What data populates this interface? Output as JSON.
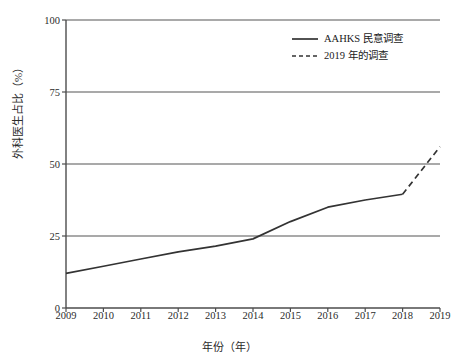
{
  "chart_data": {
    "type": "line",
    "title": "",
    "xlabel": "年份（年）",
    "ylabel": "外科医生占比（%）",
    "xlim": [
      2009,
      2019
    ],
    "ylim": [
      0,
      100
    ],
    "yticks": [
      0,
      25,
      50,
      75,
      100
    ],
    "ytick_labels": [
      "0",
      "25",
      "50",
      "75",
      "100"
    ],
    "xticks": [
      2009,
      2010,
      2011,
      2012,
      2013,
      2014,
      2015,
      2016,
      2017,
      2018,
      2019
    ],
    "xtick_labels": [
      "2009",
      "2010",
      "2011",
      "2012",
      "2013",
      "2014",
      "2015",
      "2016",
      "2017",
      "2018",
      "2019"
    ],
    "grid": "horizontal",
    "legend_position": "top-right-inside",
    "series": [
      {
        "name": "AAHKS 民意调查",
        "style": "solid",
        "color": "#333333",
        "x": [
          2009,
          2010,
          2011,
          2012,
          2013,
          2014,
          2015,
          2016,
          2017,
          2018
        ],
        "values": [
          12,
          14.5,
          17,
          19.5,
          21.5,
          24,
          30,
          35,
          37.5,
          39.5
        ]
      },
      {
        "name": "2019 年的调查",
        "style": "dashed",
        "color": "#333333",
        "x": [
          2018,
          2019
        ],
        "values": [
          39.5,
          56
        ]
      }
    ]
  },
  "legend": {
    "items": [
      {
        "label": "AAHKS 民意调查",
        "style": "solid"
      },
      {
        "label": "2019 年的调查",
        "style": "dashed"
      }
    ]
  },
  "axes": {
    "y_title": "外科医生占比（%）",
    "x_title": "年份（年）"
  },
  "colors": {
    "line": "#333333",
    "grid": "#8c8c8c",
    "axis": "#4d4d4d",
    "text": "#2b2b2b",
    "background": "#ffffff"
  }
}
